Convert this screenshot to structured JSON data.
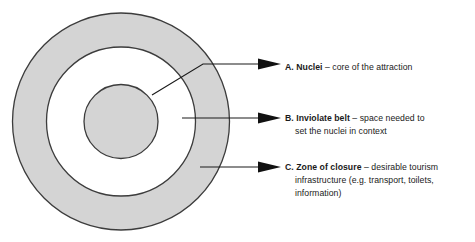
{
  "diagram": {
    "type": "concentric-circles",
    "rings": [
      {
        "id": "zone-of-closure",
        "name": "Zone of closure",
        "key": "C",
        "fill": "#d4d4d4",
        "stroke": "#3c3c3c"
      },
      {
        "id": "inviolate-belt",
        "name": "Inviolate belt",
        "key": "B",
        "fill": "#ffffff",
        "stroke": "#3c3c3c"
      },
      {
        "id": "nuclei",
        "name": "Nuclei",
        "key": "A",
        "fill": "#d4d4d4",
        "stroke": "#3c3c3c"
      }
    ]
  },
  "labels": [
    {
      "id": "a",
      "key": "A. Nuclei",
      "lines": [
        {
          "bold": "A. Nuclei",
          "rest": " – core of the attraction",
          "indented": false
        }
      ]
    },
    {
      "id": "b",
      "key": "B. Inviolate belt",
      "lines": [
        {
          "bold": "B. Inviolate belt",
          "rest": " – space needed to",
          "indented": false
        },
        {
          "bold": "",
          "rest": "set the nuclei in context",
          "indented": true
        }
      ]
    },
    {
      "id": "c",
      "key": "C. Zone of closure",
      "lines": [
        {
          "bold": "C. Zone of closure",
          "rest": " – desirable tourism",
          "indented": false
        },
        {
          "bold": "",
          "rest": "infrastructure (e.g. transport, toilets,",
          "indented": true
        },
        {
          "bold": "",
          "rest": "information)",
          "indented": true
        }
      ]
    }
  ],
  "colors": {
    "ring_fill": "#d4d4d4",
    "ring_stroke": "#3c3c3c",
    "leader_line": "#1a1a1a",
    "text": "#1a1a1a",
    "background": "#ffffff"
  }
}
